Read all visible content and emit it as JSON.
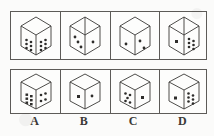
{
  "figure": {
    "title": "",
    "ink_color": "#3a3937",
    "line_color": "#5d5b58",
    "paper_color": "#fdfdfc",
    "rows": [
      {
        "name": "top-row",
        "cells": [
          {
            "id": "top-a",
            "top_face_pips": 0,
            "left_face_pips": 6,
            "right_face_pips": 6,
            "left_face_layout": "two-columns-of-three",
            "right_face_layout": "two-columns-of-three"
          },
          {
            "id": "top-b",
            "top_face_pips": 0,
            "left_face_pips": 3,
            "right_face_pips": 1,
            "left_face_layout": "diagonal-three",
            "right_face_layout": "center-one"
          },
          {
            "id": "top-c",
            "top_face_pips": 0,
            "left_face_pips": 1,
            "right_face_pips": 2,
            "left_face_layout": "center-one",
            "right_face_layout": "diagonal-two"
          },
          {
            "id": "top-d",
            "top_face_pips": 0,
            "left_face_pips": 1,
            "right_face_pips": 6,
            "left_face_layout": "center-one",
            "right_face_layout": "two-columns-of-three"
          }
        ]
      },
      {
        "name": "bottom-row",
        "cells": [
          {
            "id": "bottom-a",
            "top_face_pips": 0,
            "left_face_pips": 6,
            "right_face_pips": 4,
            "left_face_layout": "two-columns-of-three",
            "right_face_layout": "four-corners"
          },
          {
            "id": "bottom-b",
            "top_face_pips": 0,
            "left_face_pips": 1,
            "right_face_pips": 1,
            "left_face_layout": "center-one",
            "right_face_layout": "center-one"
          },
          {
            "id": "bottom-c",
            "top_face_pips": 0,
            "left_face_pips": 5,
            "right_face_pips": 1,
            "left_face_layout": "five-quincunx",
            "right_face_layout": "center-one"
          },
          {
            "id": "bottom-d",
            "top_face_pips": 0,
            "left_face_pips": 1,
            "right_face_pips": 6,
            "left_face_layout": "center-one",
            "right_face_layout": "two-columns-of-three"
          }
        ]
      }
    ],
    "labels": [
      "A",
      "B",
      "C",
      "D"
    ]
  }
}
